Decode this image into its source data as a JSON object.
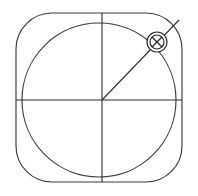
{
  "figure": {
    "background_color": "#ffffff",
    "stroke_color": "#3a3a3a",
    "marker_color": "#242424",
    "width": 198,
    "height": 196
  },
  "shapes": {
    "rounded_square": {
      "name": "rounded-square-outline",
      "x": 16,
      "y": 13,
      "width": 166,
      "height": 169,
      "corner_radius": 36
    },
    "inscribed_circle": {
      "name": "inscribed-circle",
      "cx": 99,
      "cy": 100,
      "r": 77
    },
    "horizontal_axis": {
      "name": "horizontal-axis-line",
      "x1": 16,
      "y1": 100,
      "x2": 182,
      "y2": 100
    },
    "vertical_axis": {
      "name": "vertical-axis-line",
      "x1": 102,
      "y1": 13,
      "x2": 102,
      "y2": 182
    },
    "radius_line": {
      "name": "diagonal-radius-line",
      "x1": 102,
      "y1": 100,
      "x2": 179,
      "y2": 20
    },
    "center_point": {
      "name": "axes-center-point",
      "cx": 102,
      "cy": 100
    },
    "crossed_circle_marker": {
      "name": "crossed-circle-marker",
      "cx": 157,
      "cy": 42,
      "outer_r": 10,
      "inner_r": 7,
      "cross_half": 5
    }
  }
}
